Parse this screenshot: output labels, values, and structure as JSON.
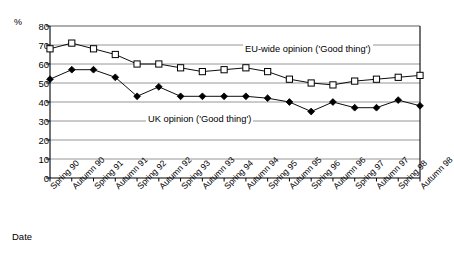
{
  "chart_data": {
    "type": "line",
    "title": "",
    "xlabel": "Date",
    "ylabel": "%",
    "ylim": [
      0,
      80
    ],
    "ytick_step": 10,
    "grid": "horizontal",
    "legend_position": "inline-annotation",
    "categories": [
      "Spring 90",
      "Autumn 90",
      "Spring 91",
      "Autumn 91",
      "Spring 92",
      "Autumn 92",
      "Spring 93",
      "Autumn 93",
      "Spring 94",
      "Autumn 94",
      "Spring 95",
      "Autumn 95",
      "Spring 96",
      "Autumn 96",
      "Spring 97",
      "Autumn 97",
      "Spring 98",
      "Autumn 98"
    ],
    "yticks": [
      0,
      10,
      20,
      30,
      40,
      50,
      60,
      70,
      80
    ],
    "series": [
      {
        "name": "EU-wide opinion ('Good thing')",
        "marker": "open-square",
        "color": "#000000",
        "values": [
          68,
          71,
          68,
          65,
          60,
          60,
          58,
          56,
          57,
          58,
          56,
          52,
          50,
          49,
          51,
          52,
          53,
          54
        ]
      },
      {
        "name": "UK opinion ('Good thing')",
        "marker": "filled-diamond",
        "color": "#000000",
        "values": [
          52,
          57,
          57,
          53,
          43,
          48,
          43,
          43,
          43,
          43,
          42,
          40,
          35,
          40,
          37,
          37,
          41,
          38
        ]
      }
    ],
    "annotations": [
      {
        "text": "EU-wide opinion ('Good thing')",
        "series": "EU-wide opinion ('Good thing')"
      },
      {
        "text": "UK opinion ('Good thing')",
        "series": "UK opinion ('Good thing')"
      }
    ]
  }
}
